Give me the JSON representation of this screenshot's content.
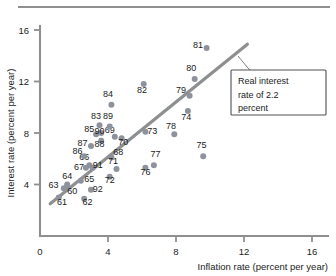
{
  "chart_data": {
    "type": "scatter",
    "title": "",
    "xlabel": "Inflation rate (percent per year)",
    "ylabel": "Interest rate (percent per year)",
    "xlim": [
      0,
      17
    ],
    "ylim": [
      0,
      17
    ],
    "xticks": [
      "0",
      "4",
      "8",
      "12",
      "16"
    ],
    "xtick_values": [
      0,
      4,
      8,
      12,
      16
    ],
    "yticks": [
      "4",
      "8",
      "12",
      "16"
    ],
    "ytick_values": [
      4,
      8,
      12,
      16
    ],
    "grid": false,
    "legend": "none",
    "point_label_field": "year",
    "points": [
      {
        "year": "60",
        "x": 1.6,
        "y": 3.8,
        "lx": 1.9,
        "ly": 3.3
      },
      {
        "year": "61",
        "x": 1.1,
        "y": 3.0,
        "lx": 1.3,
        "ly": 2.4
      },
      {
        "year": "62",
        "x": 2.6,
        "y": 2.9,
        "lx": 2.8,
        "ly": 2.4
      },
      {
        "year": "63",
        "x": 1.4,
        "y": 3.7,
        "lx": 0.8,
        "ly": 3.7
      },
      {
        "year": "64",
        "x": 1.6,
        "y": 4.0,
        "lx": 1.6,
        "ly": 4.4
      },
      {
        "year": "65",
        "x": 2.4,
        "y": 4.3,
        "lx": 2.9,
        "ly": 4.2
      },
      {
        "year": "66",
        "x": 2.9,
        "y": 5.5,
        "lx": 2.6,
        "ly": 5.9
      },
      {
        "year": "67",
        "x": 2.7,
        "y": 5.3,
        "lx": 2.3,
        "ly": 5.1
      },
      {
        "year": "68",
        "x": 4.2,
        "y": 6.1,
        "lx": 4.6,
        "ly": 6.3
      },
      {
        "year": "69",
        "x": 4.4,
        "y": 7.7,
        "lx": 4.1,
        "ly": 8.0
      },
      {
        "year": "70",
        "x": 4.8,
        "y": 7.6,
        "lx": 4.9,
        "ly": 7.1
      },
      {
        "year": "71",
        "x": 4.5,
        "y": 5.2,
        "lx": 4.3,
        "ly": 5.6
      },
      {
        "year": "72",
        "x": 4.1,
        "y": 4.6,
        "lx": 4.1,
        "ly": 4.1
      },
      {
        "year": "73",
        "x": 6.2,
        "y": 8.1,
        "lx": 6.6,
        "ly": 7.9
      },
      {
        "year": "74",
        "x": 8.7,
        "y": 9.7,
        "lx": 8.6,
        "ly": 9.0
      },
      {
        "year": "75",
        "x": 9.6,
        "y": 6.2,
        "lx": 9.5,
        "ly": 6.8
      },
      {
        "year": "76",
        "x": 6.2,
        "y": 5.3,
        "lx": 6.2,
        "ly": 4.7
      },
      {
        "year": "77",
        "x": 6.7,
        "y": 5.5,
        "lx": 6.8,
        "ly": 6.1
      },
      {
        "year": "78",
        "x": 7.9,
        "y": 7.9,
        "lx": 7.7,
        "ly": 8.3
      },
      {
        "year": "79",
        "x": 8.8,
        "y": 10.9,
        "lx": 8.3,
        "ly": 11.1
      },
      {
        "year": "80",
        "x": 9.1,
        "y": 12.2,
        "lx": 8.9,
        "ly": 12.8
      },
      {
        "year": "81",
        "x": 9.8,
        "y": 14.6,
        "lx": 9.3,
        "ly": 14.6
      },
      {
        "year": "82",
        "x": 6.1,
        "y": 11.8,
        "lx": 6.0,
        "ly": 11.1
      },
      {
        "year": "83",
        "x": 3.5,
        "y": 8.6,
        "lx": 3.3,
        "ly": 9.1
      },
      {
        "year": "84",
        "x": 4.2,
        "y": 10.2,
        "lx": 4.0,
        "ly": 10.8
      },
      {
        "year": "85",
        "x": 3.3,
        "y": 7.9,
        "lx": 2.9,
        "ly": 8.1
      },
      {
        "year": "86",
        "x": 2.6,
        "y": 6.2,
        "lx": 2.2,
        "ly": 6.4
      },
      {
        "year": "87",
        "x": 3.0,
        "y": 7.0,
        "lx": 2.5,
        "ly": 7.0
      },
      {
        "year": "88",
        "x": 3.6,
        "y": 7.4,
        "lx": 3.5,
        "ly": 6.9
      },
      {
        "year": "89",
        "x": 4.1,
        "y": 8.5,
        "lx": 4.0,
        "ly": 9.1
      },
      {
        "year": "90",
        "x": 3.6,
        "y": 8.0,
        "lx": 3.5,
        "ly": 7.9
      },
      {
        "year": "91",
        "x": 3.1,
        "y": 5.3,
        "lx": 3.4,
        "ly": 5.3
      },
      {
        "year": "92",
        "x": 3.0,
        "y": 3.6,
        "lx": 3.4,
        "ly": 3.4
      }
    ],
    "trend_line": {
      "x1": 0.6,
      "y1": 2.5,
      "x2": 12.2,
      "y2": 14.9,
      "annotation": "Real interest\nrate of 2.2\npercent",
      "annotation_lines": [
        "Real interest",
        "rate of 2.2",
        "percent"
      ],
      "real_interest_rate": 2.2
    }
  },
  "colors": {
    "dot": "#8d929c",
    "line": "#8d8f91",
    "axis": "#8d8f91",
    "text": "#1b1b1b",
    "box_border": "#4c5052",
    "background": "#ffffff"
  }
}
